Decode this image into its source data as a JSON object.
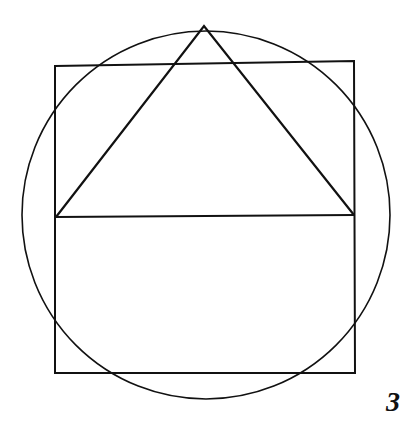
{
  "figure": {
    "label": "3",
    "stroke_color": "#111111",
    "background": "#ffffff",
    "circle": {
      "cx": 206,
      "cy": 215,
      "r": 184
    },
    "rectangle": {
      "points": [
        [
          55,
          66
        ],
        [
          354,
          61
        ],
        [
          355,
          373
        ],
        [
          55,
          373
        ]
      ]
    },
    "triangle": {
      "apex": [
        204,
        26
      ],
      "base_left": [
        56,
        217
      ],
      "base_right": [
        354,
        215
      ]
    },
    "divider_line": {
      "x1": 56,
      "y1": 217,
      "x2": 354,
      "y2": 215
    }
  }
}
